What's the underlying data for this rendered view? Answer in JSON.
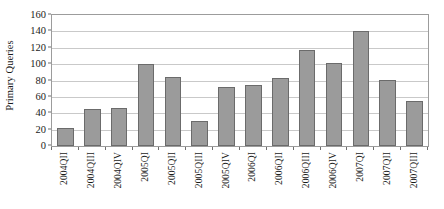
{
  "chart_data": {
    "type": "bar",
    "title": "",
    "xlabel": "",
    "ylabel": "Primary Queries",
    "ylim": [
      0,
      160
    ],
    "ytick_step": 20,
    "yticks": [
      0,
      20,
      40,
      60,
      80,
      100,
      120,
      140,
      160
    ],
    "grid": true,
    "legend": false,
    "legend_position": "none",
    "bar_fill_color": "#9b9b9b",
    "bar_border_color": "#6b6b6b",
    "gridline_color": "#c9c9c9",
    "axis_color": "#9c9c9c",
    "categories": [
      "2004QII",
      "2004QIII",
      "2004QIV",
      "2005QI",
      "2005QII",
      "2005QIII",
      "2005QIV",
      "2006QI",
      "2006QII",
      "2006QIII",
      "2006QIV",
      "2007QI",
      "2007QII",
      "2007QIII"
    ],
    "values": [
      22,
      45,
      47,
      100,
      84,
      31,
      72,
      75,
      83,
      117,
      102,
      140,
      81,
      55
    ]
  }
}
